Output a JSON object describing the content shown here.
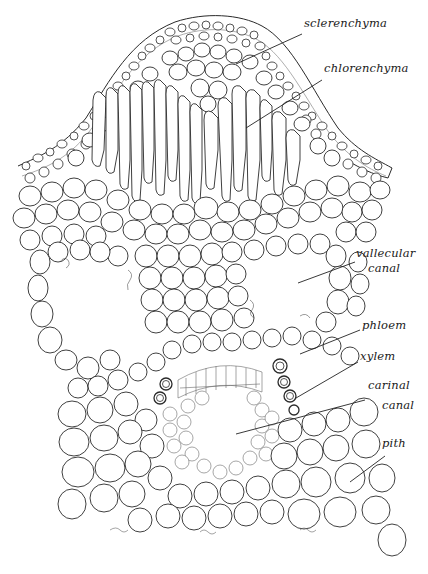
{
  "figure": {
    "colors": {
      "background": "#ffffff",
      "ink": "#2a2a2a"
    }
  },
  "labels": [
    {
      "id": "sclerenchyma",
      "text": "sclerenchyma",
      "x": 304,
      "y": 24,
      "pointer": {
        "x1": 302,
        "y1": 34,
        "x2": 236,
        "y2": 64
      }
    },
    {
      "id": "chlorenchyma",
      "text": "chlorenchyma",
      "x": 324,
      "y": 68,
      "pointer": {
        "x1": 322,
        "y1": 80,
        "x2": 246,
        "y2": 128
      }
    },
    {
      "id": "vallecular-canal-line1",
      "text": "vallecular",
      "x": 356,
      "y": 252
    },
    {
      "id": "vallecular-canal-line2",
      "text": "canal",
      "x": 368,
      "y": 268,
      "pointer": {
        "x1": 355,
        "y1": 262,
        "x2": 298,
        "y2": 283
      }
    },
    {
      "id": "phloem",
      "text": "phloem",
      "x": 362,
      "y": 322,
      "pointer": {
        "x1": 360,
        "y1": 330,
        "x2": 300,
        "y2": 354
      }
    },
    {
      "id": "xylem",
      "text": "xylem",
      "x": 360,
      "y": 353,
      "pointer": {
        "x1": 358,
        "y1": 362,
        "x2": 296,
        "y2": 398
      }
    },
    {
      "id": "carinal-canal-line1",
      "text": "carinal",
      "x": 368,
      "y": 383
    },
    {
      "id": "carinal-canal-line2",
      "text": "canal",
      "x": 382,
      "y": 406,
      "pointer": {
        "x1": 365,
        "y1": 400,
        "x2": 236,
        "y2": 434
      }
    },
    {
      "id": "pith",
      "text": "pith",
      "x": 382,
      "y": 441,
      "pointer": {
        "x1": 385,
        "y1": 456,
        "x2": 350,
        "y2": 482
      }
    }
  ]
}
